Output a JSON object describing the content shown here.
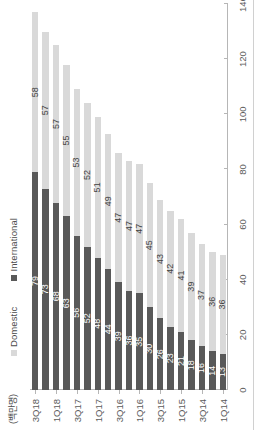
{
  "chart_data": {
    "type": "bar",
    "subtype": "stacked-horizontal",
    "orientation": "rotated-90-ccw",
    "title": "",
    "xlabel": "",
    "ylabel": "(백만명)",
    "unit_label": "(백만명)",
    "ylim": [
      0,
      140
    ],
    "tick_values": [
      0,
      20,
      40,
      60,
      80,
      100,
      120,
      140
    ],
    "grid": false,
    "legend_position": "top-left",
    "categories": [
      "1Q14",
      "2Q14",
      "3Q14",
      "4Q14",
      "1Q15",
      "2Q15",
      "3Q15",
      "4Q15",
      "1Q16",
      "2Q16",
      "3Q16",
      "4Q16",
      "1Q17",
      "2Q17",
      "3Q17",
      "4Q17",
      "1Q18",
      "2Q18",
      "3Q18"
    ],
    "tick_categories": [
      "1Q14",
      "3Q14",
      "1Q15",
      "3Q15",
      "1Q16",
      "3Q16",
      "1Q17",
      "3Q17",
      "1Q18",
      "3Q18"
    ],
    "series": [
      {
        "name": "International",
        "color": "#595959",
        "values": [
          13,
          14,
          16,
          18,
          21,
          23,
          26,
          30,
          35,
          36,
          39,
          44,
          48,
          52,
          56,
          63,
          68,
          73,
          79
        ]
      },
      {
        "name": "Domestic",
        "color": "#d9d9d9",
        "values": [
          36,
          36,
          37,
          39,
          41,
          42,
          43,
          45,
          47,
          47,
          47,
          49,
          51,
          52,
          53,
          55,
          57,
          57,
          58
        ]
      }
    ]
  },
  "legend": {
    "items": [
      {
        "label": "Domestic",
        "color": "#d9d9d9"
      },
      {
        "label": "International",
        "color": "#595959"
      }
    ]
  },
  "axis": {
    "unit": "(백만명)",
    "tick_labels": [
      "140",
      "120",
      "100",
      "80",
      "60",
      "40",
      "20",
      "0"
    ],
    "category_tick_labels": [
      "3Q18",
      "1Q18",
      "3Q17",
      "1Q17",
      "3Q16",
      "1Q16",
      "3Q15",
      "1Q15",
      "3Q14",
      "1Q14"
    ]
  },
  "colors": {
    "domestic": "#d9d9d9",
    "international": "#595959",
    "axis": "#b6b6b6",
    "text": "#5b5b5b",
    "background": "#ffffff"
  }
}
